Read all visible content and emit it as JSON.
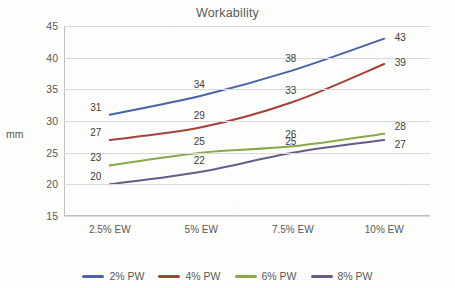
{
  "chart_data": {
    "type": "line",
    "title": "Workability",
    "xlabel": "",
    "ylabel": "mm",
    "categories": [
      "2.5% EW",
      "5% EW",
      "7.5% EW",
      "10% EW"
    ],
    "ylim": [
      15,
      45
    ],
    "yticks": [
      15,
      20,
      25,
      30,
      35,
      40,
      45
    ],
    "grid": true,
    "legend_position": "bottom",
    "series": [
      {
        "name": "2% PW",
        "color": "#4a62a8",
        "values": [
          31,
          34,
          38,
          43
        ],
        "labels": [
          "31",
          "34",
          "38",
          "43"
        ]
      },
      {
        "name": "4% PW",
        "color": "#a4423a",
        "values": [
          27,
          29,
          33,
          39
        ],
        "labels": [
          "27",
          "29",
          "33",
          "39"
        ]
      },
      {
        "name": "6% PW",
        "color": "#8aa84b",
        "values": [
          23,
          25,
          26,
          28
        ],
        "labels": [
          "23",
          "25",
          "26",
          "28"
        ]
      },
      {
        "name": "8% PW",
        "color": "#6a5a8c",
        "values": [
          20,
          22,
          25,
          27
        ],
        "labels": [
          "20",
          "22",
          "25",
          "27"
        ]
      }
    ]
  }
}
